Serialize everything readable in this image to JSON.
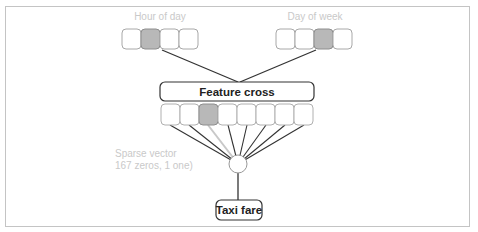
{
  "diagram": {
    "inputs": [
      {
        "label": "Hour of day",
        "cells": 4,
        "active_index": 1
      },
      {
        "label": "Day of week",
        "cells": 4,
        "active_index": 2
      }
    ],
    "feature_cross": {
      "label": "Feature cross",
      "cells": 8,
      "active_index": 2
    },
    "sparse_note": {
      "line1": "Sparse vector",
      "line2": "167 zeros, 1 one)"
    },
    "output": {
      "label": "Taxi fare"
    },
    "colors": {
      "active_cell": "#b8b8b8",
      "cell_border": "#a8a8a8",
      "line": "#333333",
      "inactive_line": "#c8c8c8",
      "label_muted": "#c9c9c9"
    }
  }
}
